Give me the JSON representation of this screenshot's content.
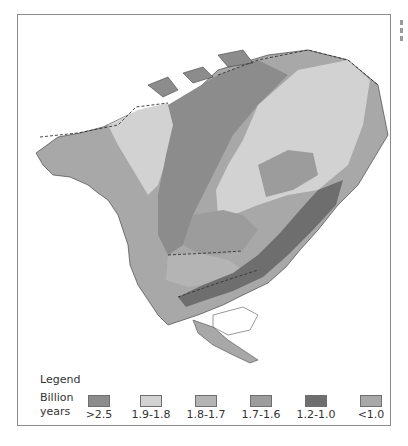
{
  "map": {
    "subject": "North America geologic province ages",
    "colors": {
      "ocean": "#ffffff",
      "gt_2_5": "#8c8c8c",
      "1_9_1_8": "#d2d2d2",
      "1_8_1_7": "#b4b4b4",
      "1_7_1_6": "#9c9c9c",
      "1_2_1_0": "#6e6e6e",
      "lt_1_0": "#a8a8a8",
      "outline": "#333333"
    }
  },
  "legend": {
    "title": "Legend",
    "unit_line1": "Billion",
    "unit_line2": "years",
    "items": [
      {
        "label": ">2.5",
        "color": "#8c8c8c"
      },
      {
        "label": "1.9-1.8",
        "color": "#d2d2d2"
      },
      {
        "label": "1.8-1.7",
        "color": "#b4b4b4"
      },
      {
        "label": "1.7-1.6",
        "color": "#9c9c9c"
      },
      {
        "label": "1.2-1.0",
        "color": "#6e6e6e"
      },
      {
        "label": "<1.0",
        "color": "#a8a8a8"
      }
    ]
  }
}
